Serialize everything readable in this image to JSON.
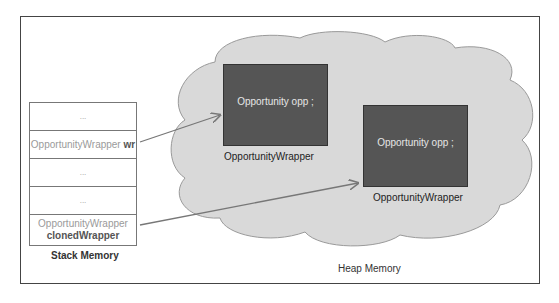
{
  "stack": {
    "title": "Stack Memory",
    "cells": [
      {
        "text": "...",
        "var": ""
      },
      {
        "text": "OpportunityWrapper",
        "var": "wr"
      },
      {
        "text": "...",
        "var": ""
      },
      {
        "text": "...",
        "var": ""
      },
      {
        "text": "OpportunityWrapper",
        "var": "clonedWrapper"
      }
    ]
  },
  "heap": {
    "title": "Heap Memory",
    "objects": [
      {
        "content": "Opportunity opp ;",
        "type_label": "OpportunityWrapper"
      },
      {
        "content": "Opportunity opp ;",
        "type_label": "OpportunityWrapper"
      }
    ]
  },
  "colors": {
    "cloud_fill": "#d9d9d9",
    "cloud_stroke": "#9a9a9a",
    "object_fill": "#555555",
    "arrow": "#777777"
  }
}
